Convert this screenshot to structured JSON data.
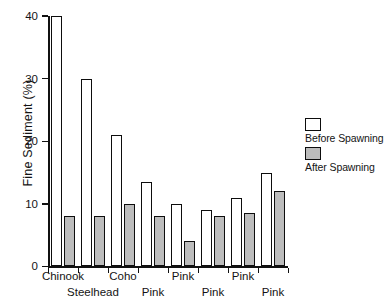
{
  "chart_data": {
    "type": "bar",
    "title": "",
    "xlabel": "",
    "ylabel": "Fine Sediment (%)",
    "ylim": [
      0,
      40
    ],
    "yticks": [
      0,
      10,
      20,
      30,
      40
    ],
    "ytick_labels": [
      "0",
      "10",
      "20",
      "30",
      "40"
    ],
    "grid": false,
    "legend_position": "right",
    "categories": [
      "Chinook",
      "Steelhead",
      "Coho",
      "Pink",
      "Pink",
      "Pink",
      "Pink",
      "Pink"
    ],
    "series": [
      {
        "name": "Before Spawning",
        "color": "#ffffff",
        "values": [
          40,
          30,
          21,
          13.5,
          10,
          9,
          11,
          15
        ]
      },
      {
        "name": "After Spawning",
        "color": "#bcbcbc",
        "values": [
          8,
          8,
          10,
          8,
          4,
          8,
          8.5,
          12
        ]
      }
    ]
  },
  "legend": {
    "items": [
      {
        "label": "Before Spawning",
        "swatch": "before"
      },
      {
        "label": "After Spawning",
        "swatch": "after"
      }
    ]
  },
  "xaxis": {
    "labels": [
      {
        "text": "Chinook",
        "row": 0
      },
      {
        "text": "Steelhead",
        "row": 1
      },
      {
        "text": "Coho",
        "row": 0
      },
      {
        "text": "Pink",
        "row": 1
      },
      {
        "text": "Pink",
        "row": 0
      },
      {
        "text": "Pink",
        "row": 1
      },
      {
        "text": "Pink",
        "row": 0
      },
      {
        "text": "Pink",
        "row": 1
      }
    ]
  }
}
